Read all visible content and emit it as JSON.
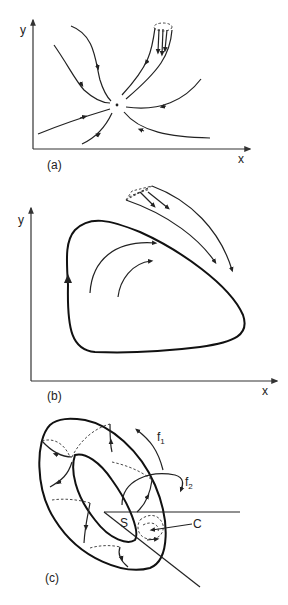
{
  "panels": [
    {
      "id": "a",
      "caption": "(a)",
      "x_axis_label": "x",
      "y_axis_label": "y",
      "description": "Trajectories converging to a stable fixed point"
    },
    {
      "id": "b",
      "caption": "(b)",
      "x_axis_label": "x",
      "y_axis_label": "y",
      "description": "Trajectories converging to a limit cycle"
    },
    {
      "id": "c",
      "caption": "(c)",
      "description": "Trajectories on a torus with Poincaré section",
      "labels": {
        "f1": "f",
        "f1_sub": "1",
        "f2": "f",
        "f2_sub": "2",
        "section": "S",
        "curve": "C"
      }
    }
  ],
  "colors": {
    "stroke": "#222222",
    "background": "#ffffff"
  }
}
